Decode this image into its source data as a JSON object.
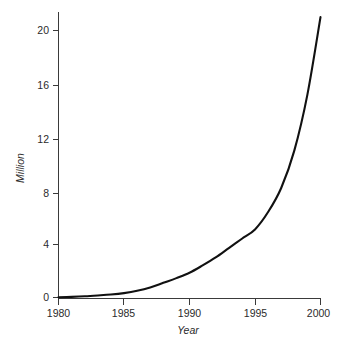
{
  "chart_data": {
    "type": "line",
    "title": "",
    "xlabel": "Year",
    "ylabel": "Million",
    "xlim": [
      1980,
      2000
    ],
    "ylim": [
      0,
      21
    ],
    "grid": false,
    "legend": null,
    "x_ticks": [
      "1980",
      "1985",
      "1990",
      "1995",
      "2000"
    ],
    "x_tick_values": [
      1980,
      1985,
      1990,
      1995,
      2000
    ],
    "y_ticks": [
      "0",
      "4",
      "8",
      "12",
      "16",
      "20"
    ],
    "y_tick_values": [
      0,
      4,
      8,
      12,
      16,
      20
    ],
    "series": [
      {
        "name": "Million",
        "color": "#111111",
        "x": [
          1980,
          1981,
          1982,
          1983,
          1984,
          1985,
          1986,
          1987,
          1988,
          1989,
          1990,
          1991,
          1992,
          1993,
          1994,
          1995,
          1996,
          1997,
          1998,
          1999,
          2000
        ],
        "values": [
          0.02,
          0.05,
          0.09,
          0.15,
          0.22,
          0.33,
          0.5,
          0.75,
          1.1,
          1.45,
          1.85,
          2.4,
          3.0,
          3.7,
          4.4,
          5.1,
          6.4,
          8.2,
          11.0,
          15.2,
          21.0
        ]
      }
    ],
    "annotations": []
  },
  "labels": {
    "y_axis_title": "Million",
    "x_axis_title": "Year",
    "y_tick_0": "0",
    "y_tick_4": "4",
    "y_tick_8": "8",
    "y_tick_12": "12",
    "y_tick_16": "16",
    "y_tick_20": "20",
    "x_tick_1980": "1980",
    "x_tick_1985": "1985",
    "x_tick_1990": "1990",
    "x_tick_1995": "1995",
    "x_tick_2000": "2000"
  },
  "colors": {
    "curve": "#111111",
    "axis": "#3a3a3a",
    "text": "#2b2b2b",
    "background": "#ffffff"
  }
}
